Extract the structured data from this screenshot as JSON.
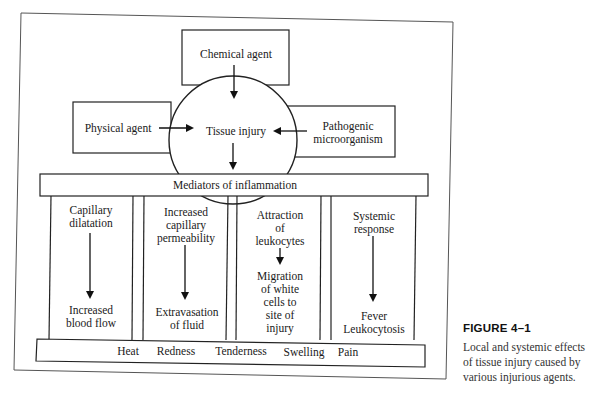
{
  "figure": {
    "center_node": "Tissue injury",
    "agents": {
      "top": "Chemical agent",
      "left": "Physical agent",
      "right": "Pathogenic\nmicroorganism"
    },
    "mediators_bar": "Mediators of inflammation",
    "columns": [
      {
        "cause": "Capillary\ndilatation",
        "effect": "Increased\nblood flow"
      },
      {
        "cause": "Increased\ncapillary\npermeability",
        "effect": "Extravasation\nof fluid"
      },
      {
        "cause": "Attraction\nof\nleukocytes",
        "effect": "Migration\nof white\ncells to\nsite of\ninjury"
      },
      {
        "cause": "Systemic\nresponse",
        "effect": "Fever\nLeukocytosis"
      }
    ],
    "signs": [
      "Heat",
      "Redness",
      "Tenderness",
      "Swelling",
      "Pain"
    ]
  },
  "caption": {
    "title": "FIGURE 4–1",
    "text": "Local and systemic effects\nof tissue injury caused by\nvarious injurious agents."
  }
}
